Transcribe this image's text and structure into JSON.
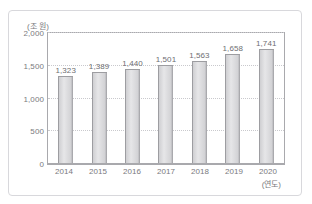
{
  "figure": {
    "partial_title": "",
    "y_unit_caption": "(조 원)",
    "x_unit_caption": "(연도)"
  },
  "chart_data": {
    "type": "bar",
    "title": "",
    "subtitle": "",
    "xlabel": "(연도)",
    "ylabel": "(조 원)",
    "categories": [
      "2014",
      "2015",
      "2016",
      "2017",
      "2018",
      "2019",
      "2020"
    ],
    "values": [
      1323,
      1389,
      1440,
      1501,
      1563,
      1658,
      1741
    ],
    "value_labels": [
      "1,323",
      "1,389",
      "1,440",
      "1,501",
      "1,563",
      "1,658",
      "1,741"
    ],
    "ylim": [
      0,
      2000
    ],
    "yticks": [
      0,
      500,
      1000,
      1500,
      2000
    ],
    "ytick_labels": [
      "0",
      "500",
      "1,000",
      "1,500",
      "2,000"
    ],
    "grid": true,
    "grid_style": "dotted",
    "legend": null,
    "legend_position": "none",
    "series": [
      {
        "name": "",
        "values": [
          1323,
          1389,
          1440,
          1501,
          1563,
          1658,
          1741
        ]
      }
    ],
    "colors": {
      "bar_fill_light": "#e6e6e8",
      "bar_fill_mid": "#cfcfd2",
      "bar_edge": "#9d9da1",
      "grid": "#c9c9cd",
      "axis": "#a9a9ad",
      "text": "#7a7a7e",
      "frame": "#d8d8dc",
      "background": "#ffffff"
    }
  }
}
